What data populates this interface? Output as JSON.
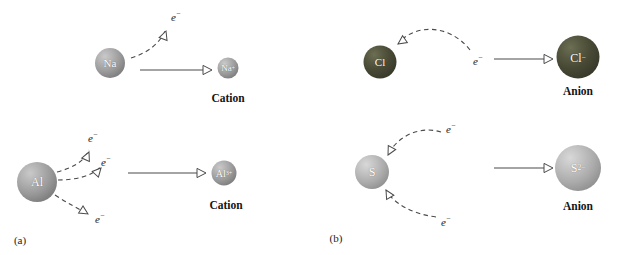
{
  "figure": {
    "panels": [
      {
        "id": "a",
        "label": "(a)",
        "label_x": 20,
        "label_y": 240,
        "process": "cation-formation",
        "reactions": [
          {
            "id": "sodium",
            "reactant": {
              "symbol": "Na",
              "charge": "",
              "x": 110,
              "y": 63,
              "diameter": 30,
              "sphere": "gray",
              "font_size": 11
            },
            "product": {
              "symbol": "Na",
              "charge": "+",
              "x": 228,
              "y": 68,
              "diameter": 21,
              "sphere": "gray",
              "font_size": 9
            },
            "caption": "Cation",
            "caption_x": 228,
            "caption_y": 98,
            "reaction_arrow": {
              "x1": 140,
              "y1": 70,
              "x2": 212,
              "y2": 70
            },
            "electrons": [
              {
                "label": "e",
                "charge": "−",
                "label_x": 176,
                "label_y": 16,
                "path": "M 131 58 C 147 53, 160 44, 166 29",
                "arrow_x": 166,
                "arrow_y": 31,
                "arrow_angle": -70
              }
            ]
          },
          {
            "id": "aluminium",
            "reactant": {
              "symbol": "Al",
              "charge": "",
              "x": 37,
              "y": 182,
              "diameter": 40,
              "sphere": "gray",
              "font_size": 12
            },
            "product": {
              "symbol": "Al",
              "charge": "3+",
              "x": 224,
              "y": 173,
              "diameter": 25,
              "sphere": "gray",
              "font_size": 10
            },
            "caption": "Cation",
            "caption_x": 226,
            "caption_y": 205,
            "reaction_arrow": {
              "x1": 128,
              "y1": 173,
              "x2": 206,
              "y2": 173
            },
            "electrons": [
              {
                "label": "e",
                "charge": "−",
                "label_x": 93,
                "label_y": 137,
                "path": "M 57 172 C 72 168, 84 162, 89 150",
                "arrow_x": 89,
                "arrow_y": 152,
                "arrow_angle": -66
              },
              {
                "label": "e",
                "charge": "−",
                "label_x": 106,
                "label_y": 161,
                "path": "M 58 180 C 76 180, 93 176, 101 166",
                "arrow_x": 101,
                "arrow_y": 168,
                "arrow_angle": -48
              },
              {
                "label": "e",
                "charge": "−",
                "label_x": 100,
                "label_y": 218,
                "path": "M 55 195 C 67 203, 79 209, 88 214",
                "arrow_x": 88,
                "arrow_y": 214,
                "arrow_angle": 32
              }
            ]
          }
        ]
      },
      {
        "id": "b",
        "label": "(b)",
        "label_x": 336,
        "label_y": 238,
        "process": "anion-formation",
        "reactions": [
          {
            "id": "chlorine",
            "reactant": {
              "symbol": "Cl",
              "charge": "",
              "x": 380,
              "y": 62,
              "diameter": 33,
              "sphere": "dark",
              "font_size": 11
            },
            "product": {
              "symbol": "Cl",
              "charge": "−",
              "x": 578,
              "y": 57,
              "diameter": 43,
              "sphere": "dark",
              "font_size": 12
            },
            "caption": "Anion",
            "caption_x": 578,
            "caption_y": 91,
            "reaction_arrow": {
              "x1": 494,
              "y1": 59,
              "x2": 553,
              "y2": 59
            },
            "electrons": [
              {
                "label": "e",
                "charge": "−",
                "label_x": 478,
                "label_y": 60,
                "path": "M 470 50 C 448 22, 412 25, 398 44",
                "arrow_x": 398,
                "arrow_y": 44,
                "arrow_angle": 145
              }
            ]
          },
          {
            "id": "sulfur",
            "reactant": {
              "symbol": "S",
              "charge": "",
              "x": 372,
              "y": 172,
              "diameter": 34,
              "sphere": "lightgray",
              "font_size": 12
            },
            "product": {
              "symbol": "S",
              "charge": "2−",
              "x": 578,
              "y": 168,
              "diameter": 46,
              "sphere": "lightgray",
              "font_size": 12
            },
            "caption": "Anion",
            "caption_x": 578,
            "caption_y": 206,
            "reaction_arrow": {
              "x1": 494,
              "y1": 168,
              "x2": 553,
              "y2": 168
            },
            "electrons": [
              {
                "label": "e",
                "charge": "−",
                "label_x": 451,
                "label_y": 128,
                "path": "M 441 132 C 418 125, 396 138, 388 155",
                "arrow_x": 388,
                "arrow_y": 155,
                "arrow_angle": 118
              },
              {
                "label": "e",
                "charge": "−",
                "label_x": 446,
                "label_y": 221,
                "path": "M 436 217 C 412 214, 393 203, 386 190",
                "arrow_x": 386,
                "arrow_y": 190,
                "arrow_angle": 240
              }
            ]
          }
        ]
      }
    ],
    "colors": {
      "sphere_gray": "#9a9a9a",
      "sphere_light_gray": "#ababab",
      "sphere_dark_olive": "#474834",
      "stroke": "#4a4a4a",
      "text": "#141414",
      "background": "#ffffff"
    }
  }
}
